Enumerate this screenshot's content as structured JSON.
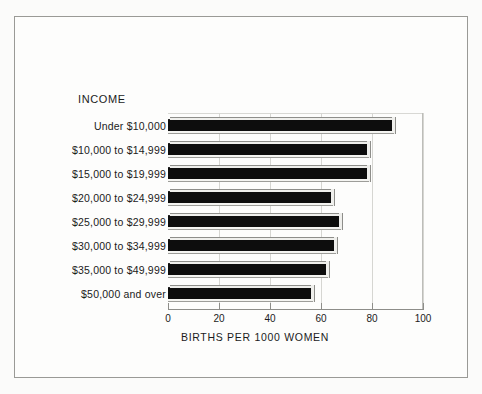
{
  "chart_data": {
    "type": "bar",
    "orientation": "horizontal",
    "title": "",
    "group_header": "INCOME",
    "xlabel": "BIRTHS PER 1000 WOMEN",
    "ylabel": "",
    "xlim": [
      0,
      100
    ],
    "xticks": [
      0,
      20,
      40,
      60,
      80,
      100
    ],
    "xtick_labels": [
      "0",
      "20",
      "40",
      "60",
      "80",
      "100"
    ],
    "grid": true,
    "legend": null,
    "categories": [
      "Under  $10,000",
      "$10,000 to $14,999",
      "$15,000 to $19,999",
      "$20,000 to $24,999",
      "$25,000 to $29,999",
      "$30,000 to $34,999",
      "$35,000 to $49,999",
      "$50,000 and over"
    ],
    "values": [
      88,
      78,
      78,
      64,
      67,
      65,
      62,
      56
    ],
    "bar_color": "#0d0d0d"
  },
  "colors": {
    "page_background": "#fdfdfc",
    "frame": "#9a9a96",
    "axis": "#8d8d89",
    "gridline": "#d6d6d2",
    "text": "#1b1b1b",
    "bar": "#0d0d0d"
  }
}
